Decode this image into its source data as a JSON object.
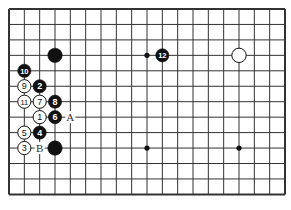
{
  "board": {
    "cols": 19,
    "rows": 13,
    "line_color": "#333333",
    "hoshi": [
      [
        9,
        3
      ],
      [
        9,
        9
      ],
      [
        15,
        9
      ]
    ],
    "stones": [
      {
        "col": 3,
        "row": 3,
        "color": "black",
        "label": ""
      },
      {
        "col": 10,
        "row": 3,
        "color": "black",
        "label": "12"
      },
      {
        "col": 15,
        "row": 3,
        "color": "white",
        "label": ""
      },
      {
        "col": 1,
        "row": 4,
        "color": "black",
        "label": "10"
      },
      {
        "col": 1,
        "row": 5,
        "color": "white",
        "label": "9"
      },
      {
        "col": 2,
        "row": 5,
        "color": "black",
        "label": "2"
      },
      {
        "col": 1,
        "row": 6,
        "color": "white",
        "label": "11"
      },
      {
        "col": 2,
        "row": 6,
        "color": "white",
        "label": "7"
      },
      {
        "col": 3,
        "row": 6,
        "color": "black",
        "label": "8"
      },
      {
        "col": 2,
        "row": 7,
        "color": "white",
        "label": "1"
      },
      {
        "col": 3,
        "row": 7,
        "color": "black",
        "label": "6"
      },
      {
        "col": 1,
        "row": 8,
        "color": "white",
        "label": "5"
      },
      {
        "col": 2,
        "row": 8,
        "color": "black",
        "label": "4"
      },
      {
        "col": 1,
        "row": 9,
        "color": "white",
        "label": "3"
      },
      {
        "col": 3,
        "row": 9,
        "color": "black",
        "label": ""
      }
    ],
    "marks": [
      {
        "col": 4,
        "row": 7,
        "label": "A"
      },
      {
        "col": 2,
        "row": 9,
        "label": "B"
      }
    ]
  }
}
